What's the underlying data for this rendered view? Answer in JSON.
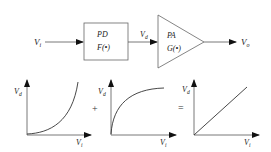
{
  "block_diagram": {
    "input_label": "V",
    "input_sub": "i",
    "pd_block": {
      "title": "PD",
      "function": "F(•)"
    },
    "mid_label": "V",
    "mid_sub": "d",
    "pa_block": {
      "title": "PA",
      "function": "G(•)"
    },
    "output_label": "V",
    "output_sub": "o"
  },
  "graphs": [
    {
      "y_label": "V",
      "y_sub": "d",
      "x_label": "V",
      "x_sub": "i",
      "curve": "expansive (convex)"
    },
    {
      "y_label": "V",
      "y_sub": "d",
      "x_label": "V",
      "x_sub": "i",
      "curve": "compressive (concave)"
    },
    {
      "y_label": "V",
      "y_sub": "d",
      "x_label": "V",
      "x_sub": "i",
      "curve": "linear"
    }
  ],
  "operators": {
    "plus": "+",
    "equals": "="
  },
  "colors": {
    "stroke": "#333333",
    "text": "#222222",
    "background": "#ffffff"
  }
}
